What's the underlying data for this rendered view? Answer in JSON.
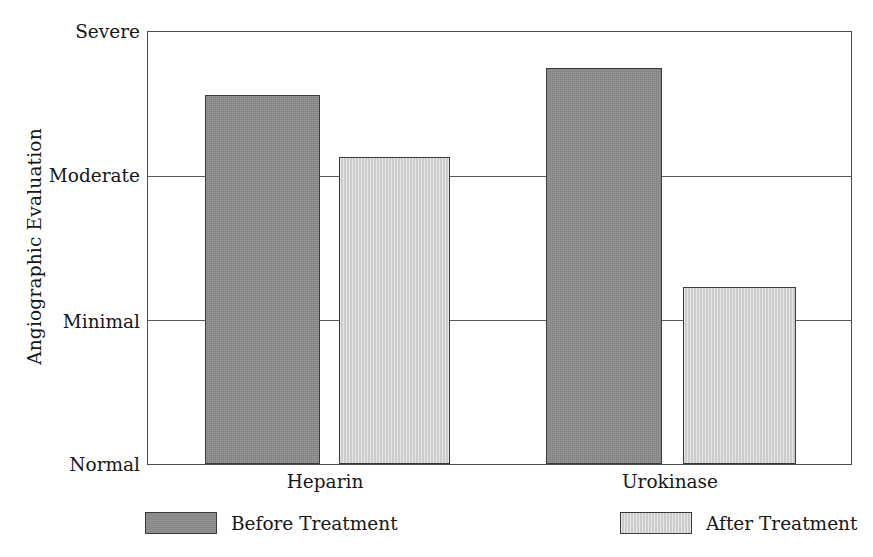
{
  "chart_data": {
    "type": "bar",
    "title": "",
    "subtitle": "",
    "xlabel": "",
    "ylabel": "Angiographic Evaluation",
    "categories": [
      "Heparin",
      "Urokinase"
    ],
    "series": [
      {
        "name": "Before Treatment",
        "color": "#8c8c8c",
        "values": [
          2.56,
          2.75
        ]
      },
      {
        "name": "After Treatment",
        "color": "#d2d2d2",
        "values": [
          2.13,
          1.23
        ]
      }
    ],
    "y_tick_labels": [
      "Severe",
      "Moderate",
      "Minimal",
      "Normal"
    ],
    "y_tick_values": [
      3,
      2,
      1,
      0
    ],
    "ylim": [
      0,
      3
    ],
    "grid": true,
    "legend_position": "bottom",
    "annotations": []
  },
  "axes": {
    "y_title": "Angiographic Evaluation",
    "y_ticks": [
      {
        "label": "Severe",
        "value": 3
      },
      {
        "label": "Moderate",
        "value": 2
      },
      {
        "label": "Minimal",
        "value": 1
      },
      {
        "label": "Normal",
        "value": 0
      }
    ],
    "x_ticks": [
      {
        "label": "Heparin"
      },
      {
        "label": "Urokinase"
      }
    ]
  },
  "legend": {
    "entries": [
      {
        "label": "Before Treatment",
        "color": "#8c8c8c"
      },
      {
        "label": "After Treatment",
        "color": "#d2d2d2"
      }
    ]
  }
}
